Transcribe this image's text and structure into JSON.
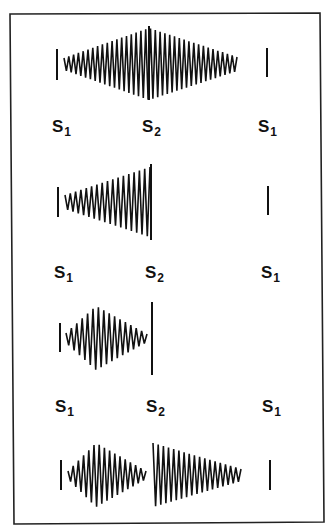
{
  "figure": {
    "colors": {
      "ink": "#111111",
      "background": "#ffffff",
      "frame": "#222222"
    },
    "frame": {
      "points": [
        [
          10,
          14
        ],
        [
          320,
          13
        ],
        [
          324,
          522
        ],
        [
          14,
          524
        ]
      ]
    },
    "label_rows": [
      {
        "y": 118,
        "items": [
          {
            "name": "s1-label",
            "main": "S",
            "sub": "1",
            "x": 52
          },
          {
            "name": "s2-label",
            "main": "S",
            "sub": "2",
            "x": 142
          },
          {
            "name": "s1-label-right",
            "main": "S",
            "sub": "1",
            "x": 258
          }
        ]
      },
      {
        "y": 264,
        "items": [
          {
            "name": "s1-label",
            "main": "S",
            "sub": "1",
            "x": 54
          },
          {
            "name": "s2-label",
            "main": "S",
            "sub": "2",
            "x": 145
          },
          {
            "name": "s1-label-right",
            "main": "S",
            "sub": "1",
            "x": 261
          }
        ]
      },
      {
        "y": 398,
        "items": [
          {
            "name": "s1-label",
            "main": "S",
            "sub": "1",
            "x": 55
          },
          {
            "name": "s2-label",
            "main": "S",
            "sub": "2",
            "x": 146
          },
          {
            "name": "s1-label-right",
            "main": "S",
            "sub": "1",
            "x": 262
          }
        ]
      }
    ],
    "panels": [
      {
        "name": "holosystolic-diamond-murmur",
        "lines": [
          {
            "name": "s1-sound-line",
            "x": 57,
            "y1": 49,
            "y2": 80
          },
          {
            "name": "s2-sound-line",
            "x": 149,
            "y1": 26,
            "y2": 100
          },
          {
            "name": "s1-sound-line-right",
            "x": 267,
            "y1": 48,
            "y2": 77
          }
        ],
        "waves": [
          {
            "name": "diamond-waveform",
            "x0": 64,
            "x1": 237,
            "cy": 64,
            "peak_x": 149,
            "amp_start": 6,
            "amp_peak": 36,
            "amp_end": 7,
            "cycles": 36
          }
        ]
      },
      {
        "name": "crescendo-murmur",
        "lines": [
          {
            "name": "s1-sound-line",
            "x": 58,
            "y1": 187,
            "y2": 217
          },
          {
            "name": "s2-sound-line",
            "x": 151,
            "y1": 164,
            "y2": 240
          },
          {
            "name": "s1-sound-line-right",
            "x": 268,
            "y1": 186,
            "y2": 215
          }
        ],
        "waves": [
          {
            "name": "crescendo-waveform",
            "x0": 65,
            "x1": 150,
            "cy": 202,
            "peak_x": 150,
            "amp_start": 7,
            "amp_peak": 35,
            "amp_end": 35,
            "cycles": 16
          }
        ]
      },
      {
        "name": "mid-systolic-ejection-murmur",
        "lines": [
          {
            "name": "s1-sound-line",
            "x": 60,
            "y1": 323,
            "y2": 352
          },
          {
            "name": "s2-sound-line",
            "x": 152,
            "y1": 302,
            "y2": 375
          }
        ],
        "waves": [
          {
            "name": "diamond-waveform",
            "x0": 66,
            "x1": 147,
            "cy": 338,
            "peak_x": 96,
            "amp_start": 5,
            "amp_peak": 32,
            "amp_end": 4,
            "cycles": 15
          }
        ]
      },
      {
        "name": "systolic-and-diastolic-murmur",
        "lines": [
          {
            "name": "s1-sound-line",
            "x": 61,
            "y1": 460,
            "y2": 490
          },
          {
            "name": "s1-sound-line-right",
            "x": 270,
            "y1": 460,
            "y2": 490
          }
        ],
        "waves": [
          {
            "name": "diamond-waveform",
            "x0": 68,
            "x1": 146,
            "cy": 475,
            "peak_x": 96,
            "amp_start": 4,
            "amp_peak": 32,
            "amp_end": 4,
            "cycles": 15
          },
          {
            "name": "decrescendo-waveform",
            "x0": 153,
            "x1": 241,
            "cy": 475,
            "peak_x": 153,
            "amp_start": 32,
            "amp_peak": 32,
            "amp_end": 6,
            "cycles": 17
          }
        ]
      }
    ]
  }
}
